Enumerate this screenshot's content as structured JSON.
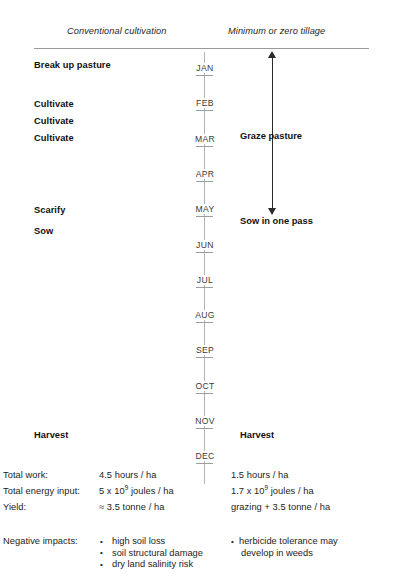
{
  "headers": {
    "left": "Conventional cultivation",
    "right": "Minimum or zero tillage"
  },
  "timeline": {
    "months": [
      "JAN",
      "FEB",
      "MAR",
      "APR",
      "MAY",
      "JUN",
      "JUL",
      "AUG",
      "SEP",
      "OCT",
      "NOV",
      "DEC"
    ]
  },
  "conventional_operations": [
    {
      "label": "Break up pasture",
      "month": "JAN"
    },
    {
      "label": "Cultivate",
      "month": "FEB"
    },
    {
      "label": "Cultivate",
      "month": "FEB"
    },
    {
      "label": "Cultivate",
      "month": "MAR"
    },
    {
      "label": "Scarify",
      "month": "MAY"
    },
    {
      "label": "Sow",
      "month": "MAY"
    },
    {
      "label": "Harvest",
      "month": "NOV"
    }
  ],
  "minimum_tillage_operations": [
    {
      "label": "Graze pasture"
    },
    {
      "label": "Sow in one pass"
    },
    {
      "label": "Harvest"
    }
  ],
  "arrow": {
    "name": "double-headed-vertical-arrow",
    "meaning": "grazing period spans January to May"
  },
  "summary": {
    "rows": [
      {
        "key": "Total work:",
        "conventional": "4.5 hours / ha",
        "minimum": "1.5 hours / ha"
      },
      {
        "key": "Total energy input:",
        "conventional_prefix": "5 x 10",
        "conventional_exp": "9",
        "conventional_suffix": " joules / ha",
        "minimum_prefix": "1.7 x 10",
        "minimum_exp": "9",
        "minimum_suffix": " joules / ha"
      },
      {
        "key": "Yield:",
        "conventional": "≈ 3.5 tonne / ha",
        "minimum": "grazing + 3.5 tonne / ha"
      }
    ],
    "impacts_key": "Negative impacts:",
    "conventional_impacts": [
      "high soil loss",
      "soil structural damage",
      "dry land salinity risk"
    ],
    "minimum_impacts": [
      {
        "line1": "herbicide tolerance may",
        "line2": "develop in weeds"
      }
    ]
  },
  "colors": {
    "text": "#1a1a1a",
    "rule": "#9a9a9a",
    "axis": "#b4b4b4",
    "arrow": "#2b2b2b",
    "background": "#ffffff"
  }
}
